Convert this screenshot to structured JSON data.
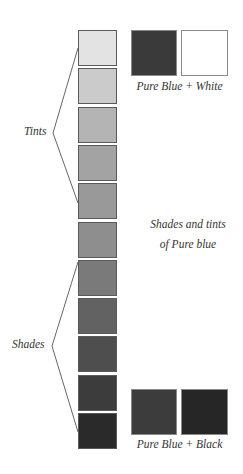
{
  "diagram": {
    "title_lines": [
      "Shades and tints",
      "of Pure blue"
    ],
    "labels": {
      "tints": "Tints",
      "shades": "Shades"
    },
    "swatches": {
      "top": {
        "caption": "Pure Blue + White",
        "left_color": "#3a3a3a",
        "right_color": "#ffffff"
      },
      "bottom": {
        "caption": "Pure Blue + Black",
        "left_color": "#3c3c3c",
        "right_color": "#262626"
      }
    },
    "column_blocks": [
      {
        "index": 1,
        "kind": "tint",
        "color": "#e3e3e3"
      },
      {
        "index": 2,
        "kind": "tint",
        "color": "#cbcbcb"
      },
      {
        "index": 3,
        "kind": "tint",
        "color": "#b4b4b4"
      },
      {
        "index": 4,
        "kind": "tint",
        "color": "#a3a3a3"
      },
      {
        "index": 5,
        "kind": "tint",
        "color": "#999999"
      },
      {
        "index": 6,
        "kind": "shade",
        "color": "#8e8e8e"
      },
      {
        "index": 7,
        "kind": "shade",
        "color": "#7a7a7a"
      },
      {
        "index": 8,
        "kind": "shade",
        "color": "#626262"
      },
      {
        "index": 9,
        "kind": "shade",
        "color": "#4e4e4e"
      },
      {
        "index": 10,
        "kind": "shade",
        "color": "#3c3c3c"
      },
      {
        "index": 11,
        "kind": "shade",
        "color": "#2a2a2a"
      }
    ]
  }
}
